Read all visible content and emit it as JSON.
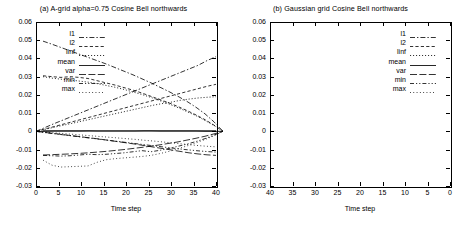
{
  "figure": {
    "panels": [
      {
        "id": "a",
        "title": "(a) A-grid alpha=0.75    Cosine Bell northwards",
        "xlabel": "Time step",
        "xticks": [
          "0",
          "5",
          "10",
          "15",
          "20",
          "25",
          "30",
          "35",
          "40"
        ],
        "yticks": [
          "0.06",
          "0.05",
          "0.04",
          "0.03",
          "0.02",
          "0.01",
          "0",
          "-0.01",
          "-0.02",
          "-0.03"
        ],
        "legend": [
          "l1",
          "l2",
          "linf",
          "mean",
          "var",
          "min",
          "max"
        ]
      },
      {
        "id": "b",
        "title": "(b) Gaussian grid    Cosine Bell northwards",
        "xlabel": "Time step",
        "xticks": [
          "40",
          "35",
          "30",
          "25",
          "20",
          "15",
          "10",
          "5",
          "0"
        ],
        "yticks": [
          "0.06",
          "0.05",
          "0.04",
          "0.03",
          "0.02",
          "0.01",
          "0",
          "-0.01",
          "-0.02",
          "-0.03"
        ],
        "legend": [
          "l1",
          "l2",
          "linf",
          "mean",
          "var",
          "min",
          "max"
        ]
      }
    ]
  },
  "chart_data": [
    {
      "type": "line",
      "title": "(a) A-grid alpha=0.75    Cosine Bell northwards",
      "xlabel": "Time step",
      "ylabel": "",
      "xlim": [
        0,
        40
      ],
      "ylim": [
        -0.03,
        0.06
      ],
      "grid": false,
      "legend_position": "upper-left-inside",
      "x": [
        0,
        2,
        4,
        6,
        8,
        10,
        12,
        14,
        16,
        18,
        20,
        22,
        24,
        26,
        28,
        30,
        32,
        34,
        36,
        38,
        40
      ],
      "series": [
        {
          "name": "l1",
          "style": "dash-dot",
          "values": [
            0.0,
            0.0021,
            0.0042,
            0.0062,
            0.0082,
            0.0102,
            0.0122,
            0.0142,
            0.0162,
            0.0182,
            0.0202,
            0.0222,
            0.0242,
            0.0262,
            0.0282,
            0.0302,
            0.0322,
            0.0342,
            0.0362,
            0.0388,
            0.041
          ]
        },
        {
          "name": "l2",
          "style": "dashed",
          "values": [
            0.0,
            0.0013,
            0.0026,
            0.0039,
            0.0052,
            0.0065,
            0.0078,
            0.0091,
            0.0104,
            0.0117,
            0.013,
            0.0143,
            0.0156,
            0.0169,
            0.0182,
            0.0195,
            0.0208,
            0.0221,
            0.0234,
            0.0247,
            0.0258
          ]
        },
        {
          "name": "linf",
          "style": "dotted",
          "values": [
            0.0,
            0.0011,
            0.0022,
            0.0033,
            0.0044,
            0.0055,
            0.0066,
            0.0077,
            0.0088,
            0.0099,
            0.011,
            0.0121,
            0.0132,
            0.0143,
            0.0152,
            0.016,
            0.017,
            0.0177,
            0.0183,
            0.0187,
            0.019
          ]
        },
        {
          "name": "mean",
          "style": "solid",
          "values": [
            0.0,
            0.0,
            0.0001,
            0.0001,
            0.0001,
            0.0001,
            0.0002,
            0.0002,
            0.0002,
            0.0002,
            0.0002,
            0.0002,
            0.0003,
            0.0003,
            0.0003,
            0.0003,
            0.0003,
            0.0003,
            0.0003,
            0.0003,
            0.0003
          ]
        },
        {
          "name": "var",
          "style": "long-dash",
          "values": [
            0.0,
            -0.0006,
            -0.0012,
            -0.0018,
            -0.0024,
            -0.003,
            -0.0036,
            -0.0042,
            -0.0049,
            -0.0056,
            -0.0063,
            -0.007,
            -0.0078,
            -0.0086,
            -0.0094,
            -0.0102,
            -0.011,
            -0.0118,
            -0.0124,
            -0.0129,
            -0.0132
          ]
        },
        {
          "name": "min",
          "style": "dash-dot-dot",
          "values": [
            0.0,
            -0.0007,
            -0.0013,
            -0.0019,
            -0.0025,
            -0.0031,
            -0.0037,
            -0.0043,
            -0.0049,
            -0.0055,
            -0.0061,
            -0.0067,
            -0.0073,
            -0.0079,
            -0.0085,
            -0.0091,
            -0.0097,
            -0.0102,
            -0.0107,
            -0.0111,
            -0.0114
          ]
        },
        {
          "name": "max",
          "style": "fine-dotted",
          "values": [
            0.0,
            -0.0004,
            -0.0008,
            -0.0012,
            -0.0016,
            -0.002,
            -0.0024,
            -0.0028,
            -0.0032,
            -0.0036,
            -0.004,
            -0.0044,
            -0.0049,
            -0.0053,
            -0.0058,
            -0.0063,
            -0.0068,
            -0.0073,
            -0.0078,
            -0.0082,
            -0.0085
          ]
        }
      ]
    },
    {
      "type": "line",
      "title": "(b) Gaussian grid    Cosine Bell northwards",
      "xlabel": "Time step",
      "ylabel": "",
      "xlim": [
        40,
        0
      ],
      "ylim": [
        -0.03,
        0.06
      ],
      "grid": false,
      "legend_position": "upper-right-inside",
      "x": [
        40,
        38,
        36,
        34,
        32,
        30,
        28,
        26,
        24,
        22,
        20,
        18,
        16,
        14,
        12,
        10,
        8,
        6,
        4,
        2,
        0
      ],
      "series": [
        {
          "name": "l1",
          "style": "dash-dot",
          "values": [
            0.0495,
            0.0478,
            0.046,
            0.0442,
            0.0424,
            0.0406,
            0.0388,
            0.037,
            0.035,
            0.033,
            0.031,
            0.0288,
            0.0266,
            0.0242,
            0.0218,
            0.0192,
            0.0164,
            0.0132,
            0.0096,
            0.0052,
            0.0
          ]
        },
        {
          "name": "l2",
          "style": "dashed",
          "values": [
            0.0305,
            0.03,
            0.0296,
            0.03,
            0.0296,
            0.029,
            0.0278,
            0.0266,
            0.0254,
            0.024,
            0.0226,
            0.021,
            0.0192,
            0.0174,
            0.0156,
            0.0136,
            0.0114,
            0.009,
            0.0064,
            0.0034,
            0.0
          ]
        },
        {
          "name": "linf",
          "style": "dotted",
          "values": [
            0.03,
            0.0292,
            0.0286,
            0.0282,
            0.0276,
            0.027,
            0.0262,
            0.0252,
            0.0242,
            0.023,
            0.0216,
            0.0202,
            0.0186,
            0.0168,
            0.015,
            0.013,
            0.0108,
            0.0086,
            0.006,
            0.0032,
            0.0
          ]
        },
        {
          "name": "mean",
          "style": "solid",
          "values": [
            0.0003,
            0.0003,
            0.0003,
            0.0003,
            0.0003,
            0.0003,
            0.0002,
            0.0002,
            0.0002,
            0.0002,
            0.0002,
            0.0002,
            0.0002,
            0.0001,
            0.0001,
            0.0001,
            0.0001,
            0.0001,
            0.0,
            0.0,
            0.0
          ]
        },
        {
          "name": "var",
          "style": "long-dash",
          "values": [
            -0.013,
            -0.0128,
            -0.0126,
            -0.0124,
            -0.0121,
            -0.0118,
            -0.0114,
            -0.011,
            -0.0105,
            -0.01,
            -0.0094,
            -0.0088,
            -0.0081,
            -0.0074,
            -0.0066,
            -0.0058,
            -0.0048,
            -0.0038,
            -0.0027,
            -0.0014,
            0.0
          ]
        },
        {
          "name": "min",
          "style": "dash-dot-dot",
          "values": [
            -0.0132,
            -0.0134,
            -0.0136,
            -0.0134,
            -0.013,
            -0.0126,
            -0.0128,
            -0.0126,
            -0.0122,
            -0.0118,
            -0.0112,
            -0.0106,
            -0.0112,
            -0.0104,
            -0.0094,
            -0.0082,
            -0.007,
            -0.0056,
            -0.004,
            -0.0021,
            0.0
          ]
        },
        {
          "name": "max",
          "style": "fine-dotted",
          "values": [
            -0.0158,
            -0.0186,
            -0.0196,
            -0.0194,
            -0.0192,
            -0.019,
            -0.017,
            -0.0156,
            -0.015,
            -0.0146,
            -0.0142,
            -0.0138,
            -0.0132,
            -0.0122,
            -0.011,
            -0.0096,
            -0.008,
            -0.0063,
            -0.0045,
            -0.0024,
            0.0
          ]
        }
      ]
    }
  ]
}
